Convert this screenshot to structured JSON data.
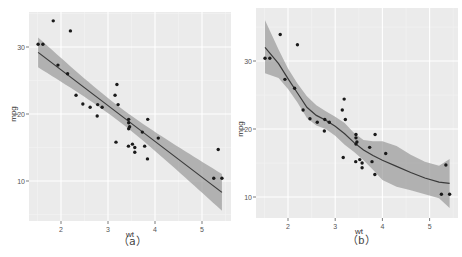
{
  "chart_data": [
    {
      "type": "scatter",
      "title": "",
      "caption": "（a）",
      "xlabel": "wt",
      "ylabel": "mpg",
      "xlim": [
        1.32,
        5.62
      ],
      "ylim": [
        7.6,
        35.3
      ],
      "xticks": [
        2,
        3,
        4,
        5
      ],
      "yticks": [
        10,
        20,
        30
      ],
      "grid": true,
      "smooth": {
        "method": "lm",
        "se": true,
        "intercept": 37.285,
        "slope": -5.344,
        "line_color": "#3a3a3a",
        "band_color": "#999999"
      },
      "points": {
        "wt": [
          2.62,
          2.875,
          2.32,
          3.215,
          3.44,
          3.46,
          3.57,
          3.19,
          3.15,
          3.44,
          3.44,
          4.07,
          3.73,
          3.78,
          5.25,
          5.424,
          5.345,
          2.2,
          1.615,
          1.835,
          2.465,
          3.52,
          3.435,
          3.84,
          3.845,
          1.935,
          2.14,
          1.513,
          3.17,
          2.77,
          3.57,
          2.78
        ],
        "mpg": [
          21.0,
          21.0,
          22.8,
          21.4,
          18.7,
          18.1,
          14.3,
          24.4,
          22.8,
          19.2,
          17.8,
          16.4,
          17.3,
          15.2,
          10.4,
          10.4,
          14.7,
          32.4,
          30.4,
          33.9,
          21.5,
          15.5,
          15.2,
          13.3,
          19.2,
          27.3,
          26.0,
          30.4,
          15.8,
          19.7,
          15.0,
          21.4
        ]
      }
    },
    {
      "type": "scatter",
      "title": "",
      "caption": "（b）",
      "xlabel": "wt",
      "ylabel": "mpg",
      "xlim": [
        1.32,
        5.62
      ],
      "ylim": [
        7.6,
        35.3
      ],
      "xticks": [
        2,
        3,
        4,
        5
      ],
      "yticks": [
        10,
        20,
        30
      ],
      "grid": true,
      "smooth": {
        "method": "loess",
        "se": true,
        "line_color": "#3a3a3a",
        "band_color": "#999999",
        "x": [
          1.513,
          1.8,
          2.0,
          2.2,
          2.4,
          2.6,
          2.8,
          3.0,
          3.2,
          3.4,
          3.6,
          3.8,
          4.0,
          4.3,
          4.6,
          4.9,
          5.2,
          5.424
        ],
        "fit": [
          32.0,
          29.6,
          27.4,
          25.3,
          23.2,
          22.0,
          21.3,
          20.4,
          19.3,
          18.0,
          16.9,
          16.1,
          15.4,
          14.5,
          13.6,
          12.8,
          12.2,
          12.0
        ],
        "lower": [
          28.2,
          27.5,
          25.9,
          23.9,
          21.6,
          20.5,
          20.0,
          19.0,
          17.7,
          16.6,
          15.4,
          14.0,
          12.5,
          11.5,
          11.0,
          10.4,
          9.8,
          8.4
        ],
        "upper": [
          36.0,
          31.7,
          28.9,
          26.7,
          24.8,
          23.5,
          22.6,
          21.8,
          20.9,
          19.4,
          18.4,
          18.2,
          18.2,
          17.5,
          16.2,
          15.2,
          14.6,
          15.6
        ]
      },
      "points": {
        "wt": [
          2.62,
          2.875,
          2.32,
          3.215,
          3.44,
          3.46,
          3.57,
          3.19,
          3.15,
          3.44,
          3.44,
          4.07,
          3.73,
          3.78,
          5.25,
          5.424,
          5.345,
          2.2,
          1.615,
          1.835,
          2.465,
          3.52,
          3.435,
          3.84,
          3.845,
          1.935,
          2.14,
          1.513,
          3.17,
          2.77,
          3.57,
          2.78
        ],
        "mpg": [
          21.0,
          21.0,
          22.8,
          21.4,
          18.7,
          18.1,
          14.3,
          24.4,
          22.8,
          19.2,
          17.8,
          16.4,
          17.3,
          15.2,
          10.4,
          10.4,
          14.7,
          32.4,
          30.4,
          33.9,
          21.5,
          15.5,
          15.2,
          13.3,
          19.2,
          27.3,
          26.0,
          30.4,
          15.8,
          19.7,
          15.0,
          21.4
        ]
      }
    }
  ],
  "layout": [
    {
      "panel": {
        "x": 29,
        "y": 12,
        "w": 202,
        "h": 209
      },
      "xmap": {
        "v0": 2,
        "p0": 61,
        "perUnit": 47
      },
      "ymap": {
        "v0": 10,
        "p0": 181,
        "per10": 67
      },
      "xlabel_pos": [
        130,
        237
      ],
      "caption_pos": [
        120,
        241
      ],
      "ylabel_pos": [
        16,
        114
      ]
    },
    {
      "panel": {
        "x": 256,
        "y": 8,
        "w": 202,
        "h": 210
      },
      "xmap": {
        "v0": 2,
        "p0": 288,
        "perUnit": 47.2
      },
      "ymap": {
        "v0": 10,
        "p0": 197,
        "per10": 68
      },
      "xlabel_pos": [
        359,
        234
      ],
      "caption_pos": [
        349,
        239
      ],
      "ylabel_pos": [
        243,
        129
      ]
    }
  ],
  "colors": {
    "panel_bg": "#ebebeb",
    "grid_major": "#ffffff",
    "grid_minor": "#f4f4f4",
    "point": "#1a1a1a",
    "tick_text": "#555555",
    "axis_title": "#333333"
  }
}
